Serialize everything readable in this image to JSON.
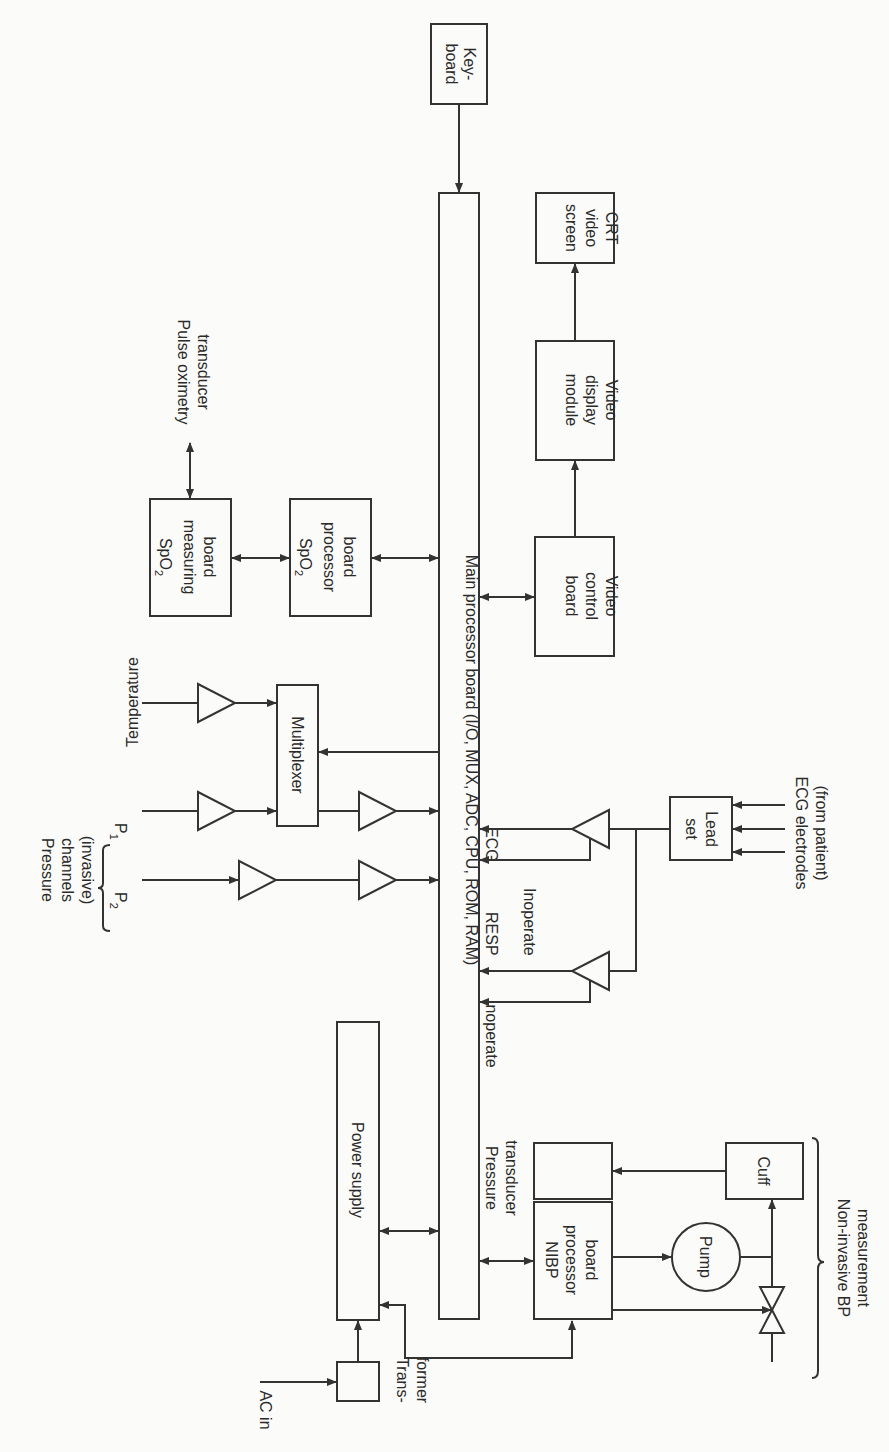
{
  "diagram": {
    "orientation": "rotated 90 degrees clockwise",
    "blocks": {
      "keyboard": {
        "line1": "Key-",
        "line2": "board"
      },
      "crt": {
        "line1": "CRT",
        "line2": "video",
        "line3": "screen"
      },
      "video_display": {
        "line1": "Video",
        "line2": "display",
        "line3": "module"
      },
      "video_control": {
        "line1": "Video",
        "line2": "control",
        "line3": "board"
      },
      "main_board": {
        "label": "Main processor board (I/O, MUX, ADC, CPU, ROM, RAM)"
      },
      "spo2_measuring": {
        "line1": "SpO",
        "sub": "2",
        "line2": "measuring",
        "line3": "board"
      },
      "spo2_processor": {
        "line1": "SpO",
        "sub": "2",
        "line2": "processor",
        "line3": "board"
      },
      "multiplexer": {
        "label": "Multiplexer"
      },
      "lead_set": {
        "line1": "Lead",
        "line2": "set"
      },
      "power_supply": {
        "label": "Power supply"
      },
      "transformer": {
        "line1": "Trans-",
        "line2": "former"
      },
      "nibp": {
        "line1": "NIBP",
        "line2": "processor",
        "line3": "board"
      },
      "pressure_transducer": {
        "line1": "Pressure",
        "line2": "transducer"
      },
      "cuff": {
        "label": "Cuff"
      },
      "pump": {
        "label": "Pump"
      }
    },
    "labels": {
      "pulse_oximetry": {
        "line1": "Pulse oximetry",
        "line2": "transducer"
      },
      "temperature": "Temperature",
      "pressure_channels": {
        "line1": "Pressure",
        "line2": "channels",
        "line3": "(invasive)"
      },
      "p1": {
        "main": "P",
        "sub": "1"
      },
      "p2": {
        "main": "P",
        "sub": "2"
      },
      "ecg": "ECG",
      "resp": "RESP",
      "inoperate_1": "Inoperate",
      "inoperate_2": "Inoperate",
      "ecg_electrodes": {
        "line1": "ECG electrodes",
        "line2": "(from patient)"
      },
      "ac_in": "AC in",
      "nibp_measurement": {
        "line1": "Non-invasive BP",
        "line2": "measurement"
      }
    }
  }
}
